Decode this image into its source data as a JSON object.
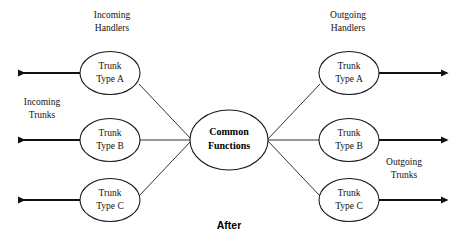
{
  "diagram": {
    "caption": "After",
    "hub": {
      "line1": "Common",
      "line2": "Functions"
    },
    "groups": {
      "incoming_handlers_line1": "Incoming",
      "incoming_handlers_line2": "Handlers",
      "outgoing_handlers_line1": "Outgoing",
      "outgoing_handlers_line2": "Handlers",
      "incoming_trunks_line1": "Incoming",
      "incoming_trunks_line2": "Trunks",
      "outgoing_trunks_line1": "Outgoing",
      "outgoing_trunks_line2": "Trunks"
    },
    "left_nodes": [
      {
        "line1": "Trunk",
        "line2": "Type A"
      },
      {
        "line1": "Trunk",
        "line2": "Type B"
      },
      {
        "line1": "Trunk",
        "line2": "Type C"
      }
    ],
    "right_nodes": [
      {
        "line1": "Trunk",
        "line2": "Type A"
      },
      {
        "line1": "Trunk",
        "line2": "Type B"
      },
      {
        "line1": "Trunk",
        "line2": "Type C"
      }
    ],
    "colors": {
      "background": "#ffffff",
      "stroke": "#1a1a1a",
      "thin_link": "#333333",
      "text": "#111111"
    }
  }
}
